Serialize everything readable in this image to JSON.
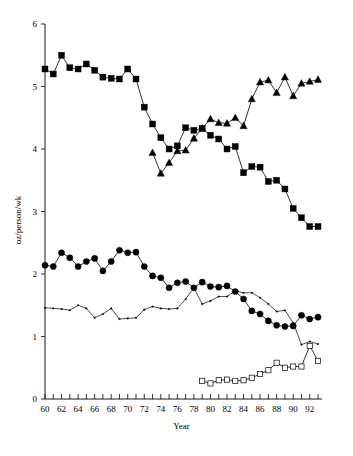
{
  "chart_data": {
    "type": "line",
    "title": "",
    "xlabel": "Year",
    "ylabel": "oz/person/wk",
    "xlim": [
      60,
      93
    ],
    "ylim": [
      0,
      6
    ],
    "ytick_labels": [
      "0",
      "1",
      "2",
      "3",
      "4",
      "5",
      "6"
    ],
    "ytick_values": [
      0,
      1,
      2,
      3,
      4,
      5,
      6
    ],
    "xtick_labels": [
      "60",
      "62",
      "64",
      "66",
      "68",
      "70",
      "72",
      "74",
      "76",
      "78",
      "80",
      "82",
      "84",
      "86",
      "88",
      "90",
      "92"
    ],
    "xtick_values": [
      60,
      62,
      64,
      66,
      68,
      70,
      72,
      74,
      76,
      78,
      80,
      82,
      84,
      86,
      88,
      90,
      92
    ],
    "xtick_minor_values": [
      61,
      63,
      65,
      67,
      69,
      71,
      73,
      75,
      77,
      79,
      81,
      83,
      85,
      87,
      89,
      91,
      93
    ],
    "grid": false,
    "legend_position": "none",
    "series": [
      {
        "name": "filled-square-series",
        "marker": "filled-square",
        "x": [
          60,
          61,
          62,
          63,
          64,
          65,
          66,
          67,
          68,
          69,
          70,
          71,
          72,
          73,
          74,
          75,
          76,
          77,
          78,
          79,
          80,
          81,
          82,
          83,
          84,
          85,
          86,
          87,
          88,
          89,
          90,
          91,
          92,
          93
        ],
        "values": [
          5.28,
          5.2,
          5.5,
          5.3,
          5.28,
          5.36,
          5.26,
          5.15,
          5.13,
          5.12,
          5.28,
          5.12,
          4.67,
          4.4,
          4.18,
          4.0,
          4.05,
          4.34,
          4.3,
          4.33,
          4.22,
          4.16,
          4.0,
          4.04,
          3.62,
          3.72,
          3.71,
          3.48,
          3.5,
          3.36,
          3.05,
          2.9,
          2.76,
          2.76
        ]
      },
      {
        "name": "filled-triangle-series",
        "marker": "filled-triangle",
        "x": [
          73,
          74,
          75,
          76,
          77,
          78,
          79,
          80,
          81,
          82,
          83,
          84,
          85,
          86,
          87,
          88,
          89,
          90,
          91,
          92,
          93
        ],
        "values": [
          3.94,
          3.61,
          3.78,
          3.97,
          3.98,
          4.17,
          4.33,
          4.48,
          4.42,
          4.41,
          4.5,
          4.37,
          4.8,
          5.07,
          5.1,
          4.9,
          5.15,
          4.85,
          5.05,
          5.08,
          5.11
        ]
      },
      {
        "name": "filled-circle-series",
        "marker": "filled-circle",
        "x": [
          60,
          61,
          62,
          63,
          64,
          65,
          66,
          67,
          68,
          69,
          70,
          71,
          72,
          73,
          74,
          75,
          76,
          77,
          78,
          79,
          80,
          81,
          82,
          83,
          84,
          85,
          86,
          87,
          88,
          89,
          90,
          91,
          92,
          93
        ],
        "values": [
          2.14,
          2.12,
          2.34,
          2.26,
          2.12,
          2.2,
          2.25,
          2.05,
          2.2,
          2.38,
          2.34,
          2.35,
          2.12,
          1.97,
          1.94,
          1.78,
          1.86,
          1.88,
          1.78,
          1.87,
          1.8,
          1.79,
          1.81,
          1.72,
          1.6,
          1.41,
          1.36,
          1.25,
          1.18,
          1.16,
          1.17,
          1.34,
          1.28,
          1.31
        ]
      },
      {
        "name": "thin-line-series",
        "marker": "small-dot",
        "x": [
          60,
          61,
          62,
          63,
          64,
          65,
          66,
          67,
          68,
          69,
          70,
          71,
          72,
          73,
          74,
          75,
          76,
          77,
          78,
          79,
          80,
          81,
          82,
          83,
          84,
          85,
          86,
          87,
          88,
          89,
          90,
          91,
          92,
          93
        ],
        "values": [
          1.46,
          1.45,
          1.44,
          1.42,
          1.5,
          1.45,
          1.3,
          1.36,
          1.45,
          1.28,
          1.29,
          1.3,
          1.43,
          1.48,
          1.45,
          1.44,
          1.45,
          1.6,
          1.78,
          1.52,
          1.57,
          1.64,
          1.64,
          1.73,
          1.7,
          1.7,
          1.62,
          1.52,
          1.4,
          1.42,
          1.22,
          0.87,
          0.92,
          0.88
        ]
      },
      {
        "name": "open-square-series",
        "marker": "open-square",
        "x": [
          79,
          80,
          81,
          82,
          83,
          84,
          85,
          86,
          87,
          88,
          89,
          90,
          91,
          92,
          93
        ],
        "values": [
          0.29,
          0.25,
          0.3,
          0.31,
          0.29,
          0.3,
          0.34,
          0.4,
          0.46,
          0.58,
          0.5,
          0.52,
          0.52,
          0.85,
          0.61
        ]
      }
    ]
  },
  "colors": {
    "foreground": "#000000",
    "background": "#ffffff"
  }
}
